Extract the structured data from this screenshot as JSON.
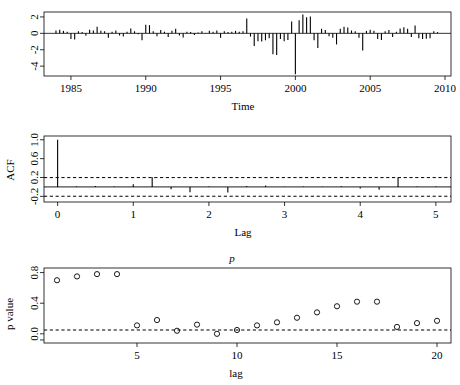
{
  "figure": {
    "kind": "r-tsdiag-residual-diagnostics",
    "background": "#ffffff",
    "foreground": "#000000",
    "panel_count": 3
  },
  "panels": {
    "timeseries": {
      "name": "standardized-residuals",
      "xlabel": "Time",
      "ylabel": "",
      "xticks": [
        "1985",
        "1990",
        "1995",
        "2000",
        "2005",
        "2010"
      ],
      "yticks": [
        "2",
        "0",
        "-2",
        "-4"
      ]
    },
    "acf": {
      "name": "acf-of-residuals",
      "xlabel": "Lag",
      "ylabel": "ACF",
      "xticks": [
        "0",
        "1",
        "2",
        "3",
        "4",
        "5"
      ],
      "yticks": [
        "1.0",
        "0.6",
        "0.2",
        "-0.2"
      ]
    },
    "pvalue": {
      "name": "ljung-box-p-values",
      "title": "p",
      "xlabel": "lag",
      "ylabel": "p value",
      "xticks": [
        "5",
        "10",
        "15",
        "20"
      ],
      "yticks": [
        "0.8",
        "0.4",
        "0.0"
      ]
    }
  },
  "chart_data": [
    {
      "type": "bar",
      "name": "standardized-residuals-series",
      "title": "",
      "xlabel": "Time",
      "ylabel": "",
      "xlim": [
        1983.2,
        2010.4
      ],
      "ylim": [
        -5.2,
        2.6
      ],
      "xticks": [
        1985,
        1990,
        1995,
        2000,
        2005,
        2010
      ],
      "yticks": [
        2,
        0,
        -2,
        -4
      ],
      "grid": false,
      "legend": false,
      "x": [
        1984.0,
        1984.25,
        1984.5,
        1984.75,
        1985.0,
        1985.25,
        1985.5,
        1985.75,
        1986.0,
        1986.25,
        1986.5,
        1986.75,
        1987.0,
        1987.25,
        1987.5,
        1987.75,
        1988.0,
        1988.25,
        1988.5,
        1988.75,
        1989.0,
        1989.25,
        1989.5,
        1989.75,
        1990.0,
        1990.25,
        1990.5,
        1990.75,
        1991.0,
        1991.25,
        1991.5,
        1991.75,
        1992.0,
        1992.25,
        1992.5,
        1992.75,
        1993.0,
        1993.25,
        1993.5,
        1993.75,
        1994.0,
        1994.25,
        1994.5,
        1994.75,
        1995.0,
        1995.25,
        1995.5,
        1995.75,
        1996.0,
        1996.25,
        1996.5,
        1996.75,
        1997.0,
        1997.25,
        1997.5,
        1997.75,
        1998.0,
        1998.25,
        1998.5,
        1998.75,
        1999.0,
        1999.25,
        1999.5,
        1999.75,
        2000.0,
        2000.25,
        2000.5,
        2000.75,
        2001.0,
        2001.25,
        2001.5,
        2001.75,
        2002.0,
        2002.25,
        2002.5,
        2002.75,
        2003.0,
        2003.25,
        2003.5,
        2003.75,
        2004.0,
        2004.25,
        2004.5,
        2004.75,
        2005.0,
        2005.25,
        2005.5,
        2005.75,
        2006.0,
        2006.25,
        2006.5,
        2006.75,
        2007.0,
        2007.25,
        2007.5,
        2007.75,
        2008.0,
        2008.25,
        2008.5,
        2008.75,
        2009.0,
        2009.25,
        2009.5
      ],
      "values": [
        0.35,
        0.45,
        0.3,
        0.2,
        -0.7,
        -0.75,
        0.25,
        0.15,
        -0.3,
        0.45,
        0.35,
        0.8,
        0.3,
        0.25,
        -0.55,
        0.2,
        0.35,
        -0.25,
        -0.4,
        0.2,
        0.6,
        0.25,
        -0.1,
        -0.85,
        1.05,
        1.0,
        0.25,
        -0.35,
        0.4,
        0.2,
        -0.45,
        0.3,
        0.55,
        -0.25,
        -0.5,
        0.2,
        0.15,
        -0.2,
        0.1,
        0.25,
        0.05,
        0.3,
        0.2,
        0.35,
        -0.55,
        0.25,
        0.15,
        0.2,
        0.3,
        0.2,
        0.25,
        1.8,
        -0.4,
        -1.55,
        -0.95,
        -1.0,
        -0.85,
        -0.6,
        -2.55,
        -2.65,
        -0.7,
        -0.95,
        -0.8,
        1.45,
        -5.0,
        1.6,
        2.3,
        1.95,
        2.05,
        -0.85,
        -1.8,
        0.55,
        0.4,
        -0.35,
        -0.55,
        -1.35,
        0.55,
        0.8,
        0.7,
        0.35,
        0.25,
        -0.55,
        -2.1,
        0.3,
        0.45,
        0.3,
        -0.7,
        -0.8,
        0.25,
        0.4,
        -0.45,
        0.2,
        0.6,
        0.75,
        0.55,
        -0.45,
        0.95,
        -0.6,
        -0.7,
        -0.65,
        -0.6,
        0.25,
        0.15
      ]
    },
    {
      "type": "bar",
      "name": "acf-series",
      "title": "",
      "xlabel": "Lag",
      "ylabel": "ACF",
      "xlim": [
        -0.18,
        5.2
      ],
      "ylim": [
        -0.32,
        1.08
      ],
      "xticks": [
        0,
        1,
        2,
        3,
        4,
        5
      ],
      "yticks": [
        1.0,
        0.6,
        0.2,
        -0.2
      ],
      "grid": false,
      "legend": false,
      "confidence_bounds": [
        0.198,
        -0.198
      ],
      "confidence_style": "dashed",
      "x": [
        0.0,
        0.25,
        0.5,
        0.75,
        1.0,
        1.25,
        1.5,
        1.75,
        2.0,
        2.25,
        2.5,
        2.75,
        3.0,
        3.25,
        3.5,
        3.75,
        4.0,
        4.25,
        4.5,
        4.75,
        5.0
      ],
      "values": [
        1.0,
        0.012,
        0.018,
        0.01,
        0.055,
        0.205,
        -0.05,
        -0.115,
        0.008,
        -0.12,
        0.02,
        0.03,
        0.006,
        0.01,
        0.005,
        0.012,
        -0.035,
        -0.06,
        0.2,
        0.01,
        0.008
      ]
    },
    {
      "type": "scatter",
      "name": "ljung-box-p-values",
      "title": "p",
      "xlabel": "lag",
      "ylabel": "p value",
      "xlim": [
        0.35,
        20.7
      ],
      "ylim": [
        -0.12,
        0.86
      ],
      "xticks": [
        5,
        10,
        15,
        20
      ],
      "yticks": [
        0.8,
        0.4,
        0.0
      ],
      "grid": false,
      "legend": false,
      "significance_line": 0.05,
      "significance_style": "dashed",
      "marker": "open-circle",
      "x": [
        1,
        2,
        3,
        4,
        5,
        6,
        7,
        8,
        9,
        10,
        11,
        12,
        13,
        14,
        15,
        16,
        17,
        18,
        19,
        20
      ],
      "values": [
        0.7,
        0.75,
        0.78,
        0.78,
        0.11,
        0.18,
        0.04,
        0.12,
        0.0,
        0.05,
        0.11,
        0.15,
        0.21,
        0.28,
        0.36,
        0.42,
        0.42,
        0.09,
        0.14,
        0.17
      ]
    }
  ]
}
